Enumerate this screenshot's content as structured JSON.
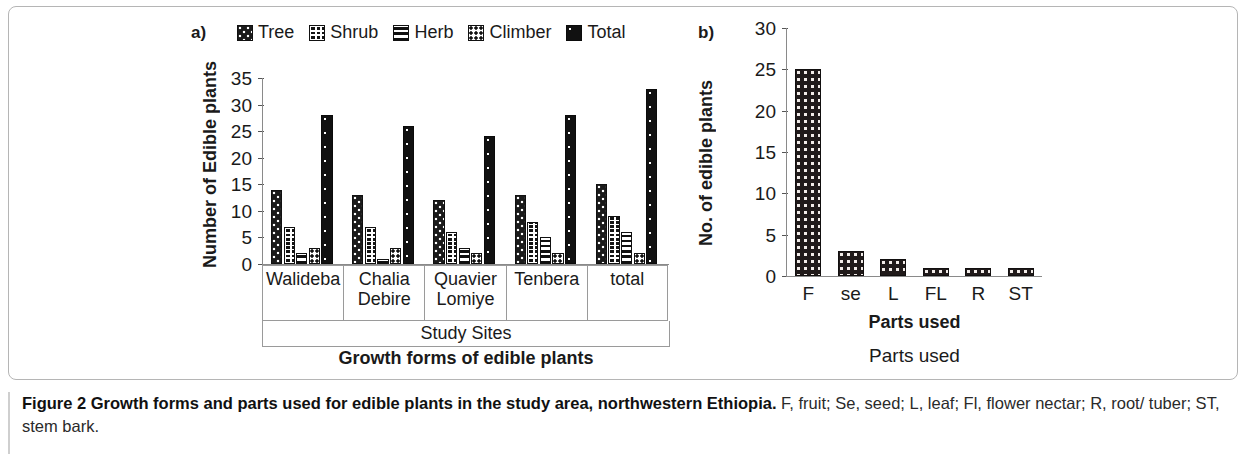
{
  "figure": {
    "caption_bold": "Figure 2 Growth forms and parts used for edible plants in the study area, northwestern Ethiopia.",
    "caption_rest": " F, fruit; Se, seed; L, leaf; Fl, flower nectar; R, root/ tuber; ST, stem bark."
  },
  "panel_a": {
    "tag": "a)",
    "legend": [
      {
        "label": "Tree",
        "pattern": "p-tree"
      },
      {
        "label": "Shrub",
        "pattern": "p-shrub"
      },
      {
        "label": "Herb",
        "pattern": "p-herb"
      },
      {
        "label": "Climber",
        "pattern": "p-climber"
      },
      {
        "label": "Total",
        "pattern": "p-total"
      }
    ],
    "ylabel": "Number of Edible plants",
    "xlabel_inner": "Study Sites",
    "xlabel_outer": "Growth forms of edible plants"
  },
  "panel_b": {
    "tag": "b)",
    "ylabel": "No. of edible plants",
    "xlabel_inner": "Parts used",
    "xlabel_outer": "Parts used"
  },
  "chart_data": [
    {
      "type": "bar",
      "title": "Growth forms of edible plants",
      "xlabel": "Study Sites",
      "ylabel": "Number of Edible plants",
      "ylim": [
        0,
        35
      ],
      "yticks": [
        0,
        5,
        10,
        15,
        20,
        25,
        30,
        35
      ],
      "grid": false,
      "legend": "top",
      "categories": [
        "Walideba",
        "Chalia Debire",
        "Quavier Lomiye",
        "Tenbera",
        "total"
      ],
      "series": [
        {
          "name": "Tree",
          "values": [
            14,
            13,
            12,
            13,
            15
          ]
        },
        {
          "name": "Shrub",
          "values": [
            7,
            7,
            6,
            8,
            9
          ]
        },
        {
          "name": "Herb",
          "values": [
            2,
            1,
            3,
            5,
            6
          ]
        },
        {
          "name": "Climber",
          "values": [
            3,
            3,
            2,
            2,
            2
          ]
        },
        {
          "name": "Total",
          "values": [
            28,
            26,
            24,
            28,
            33
          ]
        }
      ]
    },
    {
      "type": "bar",
      "title": "Parts used",
      "xlabel": "Parts used",
      "ylabel": "No. of edible plants",
      "ylim": [
        0,
        30
      ],
      "yticks": [
        0,
        5,
        10,
        15,
        20,
        25,
        30
      ],
      "grid": false,
      "legend": "none",
      "categories": [
        "F",
        "se",
        "L",
        "FL",
        "R",
        "ST"
      ],
      "values": [
        25,
        3,
        2,
        1,
        1,
        1
      ]
    }
  ]
}
